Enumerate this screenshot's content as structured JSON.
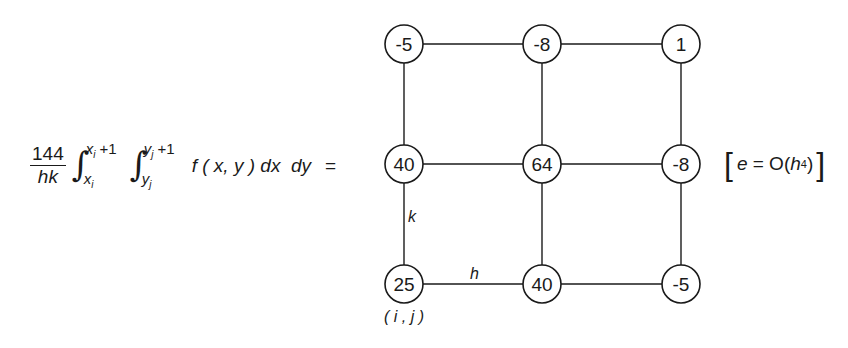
{
  "formula": {
    "coefficient_numerator": "144",
    "coefficient_denominator": "hk",
    "outer_integral": {
      "lower": "x",
      "lower_sub": "i",
      "upper": "x",
      "upper_sub": "i",
      "upper_suffix": " +1"
    },
    "inner_integral": {
      "lower": "y",
      "lower_sub": "j",
      "upper": "y",
      "upper_sub": "j",
      "upper_suffix": " +1"
    },
    "integrand": "f ( x, y ) dx  dy",
    "equals": "="
  },
  "grid": {
    "rows": [
      {
        "nodes": [
          {
            "value": "-5"
          },
          {
            "value": "-8"
          },
          {
            "value": "1"
          }
        ]
      },
      {
        "nodes": [
          {
            "value": "40"
          },
          {
            "value": "64"
          },
          {
            "value": "-8"
          }
        ]
      },
      {
        "nodes": [
          {
            "value": "25"
          },
          {
            "value": "40"
          },
          {
            "value": "-5"
          }
        ]
      }
    ],
    "edge_labels": {
      "vertical": "k",
      "horizontal": "h"
    },
    "origin_label": "( i , j )"
  },
  "error_term": {
    "open": "[",
    "e": "e",
    "eq": " = O(",
    "h": "h",
    "power": "4",
    "close_paren": ")",
    "close": "]"
  }
}
